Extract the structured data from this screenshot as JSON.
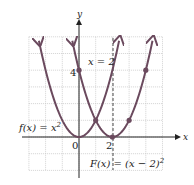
{
  "chart_data": {
    "type": "line",
    "title": "",
    "xlabel": "x",
    "ylabel": "y",
    "xlim": [
      -3,
      5
    ],
    "ylim": [
      -2,
      6
    ],
    "grid": true,
    "series": [
      {
        "name": "f(x) = x^2",
        "label": "f(x) = x",
        "label_sup": "2",
        "x": [
          -2,
          -1,
          0,
          1,
          2
        ],
        "y": [
          4,
          1,
          0,
          1,
          4
        ],
        "color": "#6b4a5e"
      },
      {
        "name": "F(x) = (x - 2)^2",
        "label": "F(x) = (x − 2)",
        "label_sup": "2",
        "x": [
          0,
          1,
          2,
          3,
          4
        ],
        "y": [
          4,
          1,
          0,
          1,
          4
        ],
        "color": "#6b4a5e"
      }
    ],
    "points": [
      {
        "x": 0,
        "y": 4
      },
      {
        "x": 1,
        "y": 1
      },
      {
        "x": 2,
        "y": 0
      },
      {
        "x": 3,
        "y": 1
      },
      {
        "x": 4,
        "y": 4
      }
    ],
    "dashed_line": {
      "label": "x = 2",
      "x": 2
    },
    "tick_labels": {
      "origin": "0",
      "x2": "2",
      "y4": "4"
    }
  }
}
